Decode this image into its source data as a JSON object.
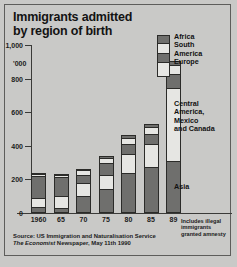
{
  "chart": {
    "title_line1": "Immigrants admitted",
    "title_line2": "by region of birth",
    "unit": "'000"
  },
  "legend": {
    "swatch_name": "legend-stack-swatch",
    "top_labels": "Africa\nSouth\nAmerica\nEurope",
    "mid_label": "Central\nAmerica,\nMexico\nand Canada",
    "bottom_label": "Asia"
  },
  "footnote": {
    "text": "Includes illegal\nimmigrants\ngranted amnesty",
    "marker": "89"
  },
  "source": {
    "line1": "Source: US Immigration and Naturalisation Service",
    "line2_italic": "The Economist",
    "line2_rest": " Newspaper, May 11th 1990"
  },
  "chart_data": {
    "type": "bar",
    "subtype": "stacked-column",
    "title": "Immigrants admitted by region of birth",
    "xlabel": "",
    "ylabel": "'000",
    "ylim": [
      0,
      1000
    ],
    "yticks": [
      0,
      200,
      400,
      600,
      800,
      1000
    ],
    "ytick_labels": [
      "0",
      "200",
      "400",
      "600",
      "800",
      "1,000"
    ],
    "grid": false,
    "legend_position": "top-right",
    "categories": [
      "1960",
      "65",
      "70",
      "75",
      "80",
      "85",
      "89"
    ],
    "category_notes": {
      "89": "Includes illegal immigrants granted amnesty"
    },
    "series": [
      {
        "name": "Asia",
        "color": "#6f6f6d",
        "values": [
          25,
          22,
          95,
          135,
          230,
          265,
          300
        ]
      },
      {
        "name": "Central America, Mexico and Canada",
        "color": "#e6e6e3",
        "values": [
          55,
          75,
          80,
          90,
          120,
          140,
          440
        ]
      },
      {
        "name": "Europe",
        "color": "#6f6f6d",
        "values": [
          140,
          115,
          50,
          70,
          60,
          65,
          85
        ]
      },
      {
        "name": "South America",
        "color": "#e6e6e3",
        "values": [
          15,
          18,
          28,
          30,
          38,
          42,
          55
        ]
      },
      {
        "name": "Africa",
        "color": "#6f6f6d",
        "values": [
          5,
          5,
          10,
          12,
          15,
          18,
          25
        ]
      }
    ],
    "totals": [
      240,
      235,
      263,
      337,
      463,
      530,
      905
    ]
  }
}
